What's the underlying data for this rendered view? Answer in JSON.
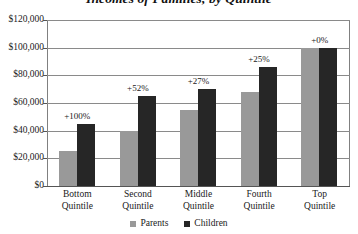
{
  "chart_data": {
    "type": "bar",
    "title": "Incomes of Families, by Quintile",
    "xlabel": "",
    "ylabel": "",
    "ylim": [
      0,
      120000
    ],
    "ytick_values": [
      0,
      20000,
      40000,
      60000,
      80000,
      100000,
      120000
    ],
    "ytick_labels": [
      "$0",
      "$20,000",
      "$40,000",
      "$60,000",
      "$80,000",
      "$100,000",
      "$120,000"
    ],
    "grid": true,
    "legend_position": "bottom",
    "categories": [
      "Bottom Quintile",
      "Second Quintile",
      "Middle Quintile",
      "Fourth Quintile",
      "Top Quintile"
    ],
    "category_lines": [
      [
        "Bottom",
        "Quintile"
      ],
      [
        "Second",
        "Quintile"
      ],
      [
        "Middle",
        "Quintile"
      ],
      [
        "Fourth",
        "Quintile"
      ],
      [
        "Top",
        "Quintile"
      ]
    ],
    "series": [
      {
        "name": "Parents",
        "color": "#999999",
        "values": [
          25000,
          40000,
          55000,
          68000,
          100000
        ]
      },
      {
        "name": "Children",
        "color": "#262626",
        "values": [
          45000,
          65000,
          70000,
          86000,
          100000
        ]
      }
    ],
    "annotations": [
      "+100%",
      "+52%",
      "+27%",
      "+25%",
      "+0%"
    ]
  },
  "legend": {
    "items": [
      {
        "label": "Parents",
        "color": "#999999"
      },
      {
        "label": "Children",
        "color": "#262626"
      }
    ]
  }
}
